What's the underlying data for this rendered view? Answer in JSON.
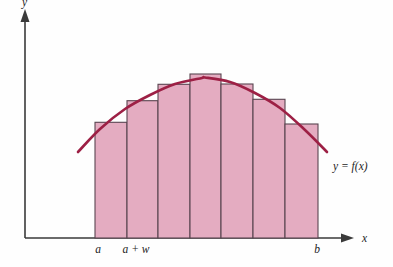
{
  "figure": {
    "title": "",
    "background_color": "#fefefe"
  },
  "colors": {
    "bar_fill": "#e4acc1",
    "bar_stroke": "#5a4550",
    "curve": "#9d2045",
    "axis": "#3a3a3a",
    "text": "#1d1d1d"
  },
  "axes": {
    "x_axis_label": "x",
    "y_axis_label": "y",
    "x_axis_y_px": 238,
    "y_axis_x_px": 25,
    "x_axis_start_px": 25,
    "x_axis_end_px": 352,
    "y_axis_top_px": 12,
    "has_arrowheads": true,
    "grid": false
  },
  "tick_labels": [
    {
      "text": "a",
      "x_px": 98,
      "y_px": 253
    },
    {
      "text": "a + w",
      "x_px": 136,
      "y_px": 253
    },
    {
      "text": "b",
      "x_px": 317,
      "y_px": 253
    }
  ],
  "annotations": [
    {
      "name": "curve-equation",
      "text": "y = f(x)",
      "x_px": 333,
      "y_px": 170
    }
  ],
  "chart_data": {
    "type": "bar",
    "title": "",
    "subtitle": "",
    "xlabel": "x",
    "ylabel": "y",
    "grid": false,
    "legend": null,
    "categories": [
      "1",
      "2",
      "3",
      "4",
      "5",
      "6",
      "7"
    ],
    "values": [
      115.7,
      137.3,
      153.7,
      164.0,
      154.0,
      138.7,
      114.0
    ],
    "bar_edges_px": [
      95,
      127,
      158,
      190,
      221,
      253,
      285,
      318
    ],
    "bar_tops_px": [
      122.3,
      100.7,
      84.3,
      74.0,
      84.0,
      99.3,
      124.0
    ],
    "baseline_px": 238,
    "bar_count": 7,
    "interval_start_label": "a",
    "interval_end_label": "b",
    "width_label": "a + w",
    "ylim": [
      0,
      238
    ],
    "series": [
      {
        "name": "f(x)",
        "type": "line",
        "curve_points_px": [
          [
            78,
            152
          ],
          [
            100,
            129
          ],
          [
            125,
            109
          ],
          [
            150,
            95
          ],
          [
            175,
            84
          ],
          [
            202,
            78
          ],
          [
            205,
            77.5
          ],
          [
            230,
            82
          ],
          [
            255,
            93
          ],
          [
            280,
            108
          ],
          [
            305,
            130
          ],
          [
            327,
            152
          ]
        ]
      }
    ]
  }
}
